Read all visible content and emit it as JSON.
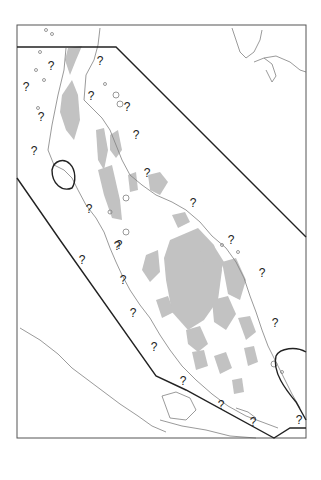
{
  "map": {
    "frame": {
      "x": 17,
      "y": 25,
      "width": 289,
      "height": 413
    },
    "colors": {
      "frame": "#555555",
      "coastline": "#777777",
      "highland": "#bdbdbd",
      "boundary": "#222222",
      "label": "#222222"
    },
    "boundary_polygon": [
      [
        17,
        47
      ],
      [
        116,
        47
      ],
      [
        306,
        237
      ],
      [
        306,
        425
      ],
      [
        290,
        425
      ],
      [
        274,
        438
      ],
      [
        186,
        376
      ],
      [
        156,
        376
      ],
      [
        17,
        178
      ]
    ],
    "uncertainty_markers": [
      {
        "label": "?",
        "x": 51,
        "y": 66
      },
      {
        "label": "?",
        "x": 100,
        "y": 61
      },
      {
        "label": "?",
        "x": 26,
        "y": 87
      },
      {
        "label": "?",
        "x": 91,
        "y": 96
      },
      {
        "label": "?",
        "x": 127,
        "y": 107
      },
      {
        "label": "?",
        "x": 41,
        "y": 117
      },
      {
        "label": "?",
        "x": 136,
        "y": 135
      },
      {
        "label": "?",
        "x": 34,
        "y": 151
      },
      {
        "label": "?",
        "x": 147,
        "y": 173
      },
      {
        "label": "?",
        "x": 193,
        "y": 203
      },
      {
        "label": "?",
        "x": 89,
        "y": 209
      },
      {
        "label": "?",
        "x": 119,
        "y": 245
      },
      {
        "label": "?",
        "x": 231,
        "y": 240
      },
      {
        "label": "?",
        "x": 82,
        "y": 260
      },
      {
        "label": "?",
        "x": 117,
        "y": 246
      },
      {
        "label": "?",
        "x": 262,
        "y": 273
      },
      {
        "label": "?",
        "x": 123,
        "y": 280
      },
      {
        "label": "?",
        "x": 133,
        "y": 313
      },
      {
        "label": "?",
        "x": 275,
        "y": 323
      },
      {
        "label": "?",
        "x": 154,
        "y": 347
      },
      {
        "label": "?",
        "x": 183,
        "y": 381
      },
      {
        "label": "?",
        "x": 221,
        "y": 405
      },
      {
        "label": "?",
        "x": 253,
        "y": 422
      },
      {
        "label": "?",
        "x": 299,
        "y": 420
      }
    ]
  }
}
